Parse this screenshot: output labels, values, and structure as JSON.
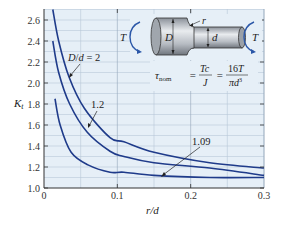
{
  "chart_data": {
    "type": "line",
    "title": "",
    "xlabel": "r/d",
    "ylabel": "K_t",
    "xlim": [
      0,
      0.3
    ],
    "ylim": [
      1.0,
      2.7
    ],
    "x_ticks": [
      "0",
      "0.1",
      "0.2",
      "0.3"
    ],
    "y_ticks": [
      "1.0",
      "1.2",
      "1.4",
      "1.6",
      "1.8",
      "2.0",
      "2.2",
      "2.4",
      "2.6"
    ],
    "grid": true,
    "background_color": "#e6eff7",
    "line_color": "#1f3b8a",
    "series": [
      {
        "name": "D/d = 2",
        "label": "D/d = 2",
        "x": [
          0.012,
          0.02,
          0.034,
          0.055,
          0.09,
          0.109,
          0.15,
          0.226,
          0.3
        ],
        "y": [
          2.7,
          2.4,
          2.06,
          1.76,
          1.48,
          1.44,
          1.34,
          1.24,
          1.19
        ]
      },
      {
        "name": "D/d = 1.2",
        "label": "1.2",
        "x": [
          0.012,
          0.02,
          0.035,
          0.059,
          0.09,
          0.109,
          0.15,
          0.226,
          0.3
        ],
        "y": [
          2.4,
          2.1,
          1.8,
          1.53,
          1.35,
          1.3,
          1.24,
          1.19,
          1.12
        ]
      },
      {
        "name": "D/d = 1.09",
        "label": "1.09",
        "x": [
          0.015,
          0.022,
          0.037,
          0.06,
          0.09,
          0.109,
          0.15,
          0.226,
          0.3
        ],
        "y": [
          1.85,
          1.6,
          1.34,
          1.22,
          1.15,
          1.15,
          1.12,
          1.1,
          1.1
        ]
      }
    ],
    "annotations": [
      {
        "text": "D/d = 2",
        "points_to": "D/d = 2 curve"
      },
      {
        "text": "1.2",
        "points_to": "D/d = 1.2 curve"
      },
      {
        "text": "1.09",
        "points_to": "D/d = 1.09 curve"
      }
    ],
    "inset": {
      "description": "Stepped shaft under torsion T with fillet radius r, diameters D and d",
      "labels": {
        "torque_left": "T",
        "torque_right": "T",
        "large_diameter": "D",
        "small_diameter": "d",
        "fillet_radius": "r"
      },
      "formula": {
        "lhs": "τ",
        "lhs_sub": "nom",
        "eq1_num": "Tc",
        "eq1_den": "J",
        "eq2_num": "16T",
        "eq2_den": "πd",
        "eq2_den_exp": "3"
      }
    }
  }
}
